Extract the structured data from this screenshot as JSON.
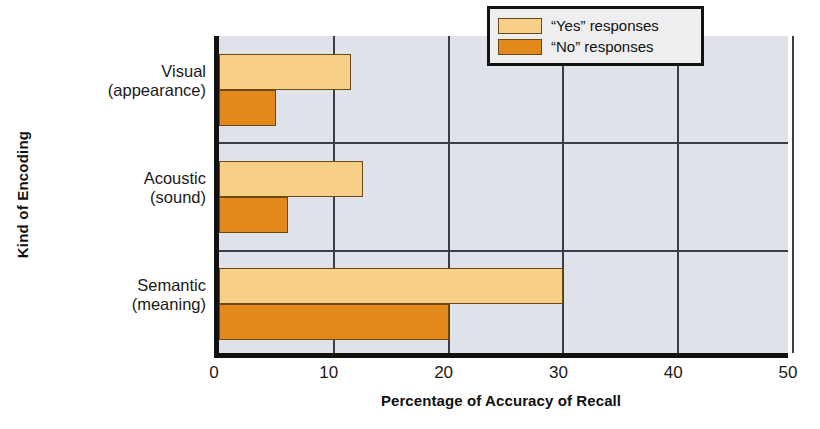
{
  "chart_data": {
    "type": "bar",
    "orientation": "horizontal",
    "title": "",
    "xlabel": "Percentage of Accuracy of Recall",
    "ylabel": "Kind of Encoding",
    "categories": [
      {
        "line1": "Visual",
        "line2": "(appearance)"
      },
      {
        "line1": "Acoustic",
        "line2": "(sound)"
      },
      {
        "line1": "Semantic",
        "line2": "(meaning)"
      }
    ],
    "category_names": [
      "Visual (appearance)",
      "Acoustic (sound)",
      "Semantic (meaning)"
    ],
    "series": [
      {
        "name": "“Yes” responses",
        "color": "#f7cf88",
        "values": [
          11.5,
          12.5,
          30
        ]
      },
      {
        "name": "“No” responses",
        "color": "#e3881b",
        "values": [
          5,
          6,
          20
        ]
      }
    ],
    "xlim": [
      0,
      50
    ],
    "xticks": [
      "0",
      "10",
      "20",
      "30",
      "40",
      "50"
    ],
    "xtick_values": [
      0,
      10,
      20,
      30,
      40,
      50
    ],
    "grid": "vertical-and-category-separators",
    "legend_position": "top-right",
    "plot_background": "#dfe2e8"
  },
  "legend": {
    "items": [
      {
        "label": "“Yes” responses",
        "swatch": "yes"
      },
      {
        "label": "“No” responses",
        "swatch": "no"
      }
    ]
  }
}
